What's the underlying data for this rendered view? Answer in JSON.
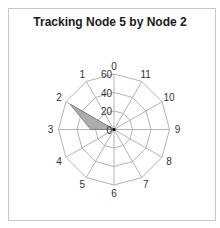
{
  "chart_data": {
    "type": "radar",
    "title": "Tracking Node 5 by Node 2",
    "categories": [
      "0",
      "1",
      "2",
      "3",
      "4",
      "5",
      "6",
      "7",
      "8",
      "9",
      "10",
      "11"
    ],
    "series": [
      {
        "name": "Node 2",
        "values": [
          0,
          0,
          55,
          25,
          0,
          0,
          0,
          0,
          0,
          0,
          0,
          0
        ]
      }
    ],
    "rlim": [
      0,
      60
    ],
    "rticks": [
      0,
      20,
      40,
      60
    ],
    "grid": true,
    "legend": "none"
  },
  "colors": {
    "grid": "#b4b4b4",
    "fill": "#a0a0a0",
    "stroke": "#808080",
    "frame": "#c8c8c8"
  }
}
